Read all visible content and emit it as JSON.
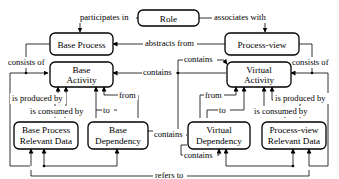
{
  "diagram": {
    "nodes": {
      "role": {
        "lines": [
          "Role"
        ]
      },
      "base_process": {
        "lines": [
          "Base Process"
        ]
      },
      "process_view": {
        "lines": [
          "Process-view"
        ]
      },
      "base_activity": {
        "lines": [
          "Base",
          "Activity"
        ]
      },
      "virtual_activity": {
        "lines": [
          "Virtual",
          "Activity"
        ]
      },
      "base_process_relevant_data": {
        "lines": [
          "Base Process",
          "Relevant Data"
        ]
      },
      "base_dependency": {
        "lines": [
          "Base",
          "Dependency"
        ]
      },
      "virtual_dependency": {
        "lines": [
          "Virtual",
          "Dependency"
        ]
      },
      "process_view_relevant_data": {
        "lines": [
          "Process-view",
          "Relevant Data"
        ]
      }
    },
    "edges": {
      "participates_in": "participates in",
      "associates_with": "associates with",
      "abstracts_from": "abstracts from",
      "consists_of_left": "consists of",
      "consists_of_right": "consists of",
      "contains_ba": "contains",
      "contains_va": "contains",
      "from_left": "from",
      "to_left": "to",
      "from_right": "from",
      "to_right": "to",
      "is_produced_by_left": "is produced by",
      "is_consumed_by_left": "is consumed by",
      "is_produced_by_right": "is produced by",
      "is_consumed_by_right": "is consumed by",
      "contains_bd": "contains",
      "contains_vd": "contains",
      "refers_to": "refers to"
    }
  }
}
